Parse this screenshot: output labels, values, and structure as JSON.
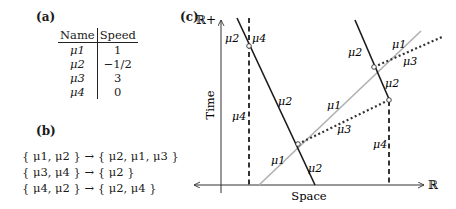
{
  "panel_a": {
    "label": "(a)",
    "table": {
      "headers": [
        "Name",
        "Speed"
      ],
      "rows": [
        {
          "name": "μ1",
          "speed": "1"
        },
        {
          "name": "μ2",
          "speed": "−1/2"
        },
        {
          "name": "μ3",
          "speed": "3"
        },
        {
          "name": "μ4",
          "speed": "0"
        }
      ]
    }
  },
  "panel_b": {
    "label": "(b)",
    "rules": [
      "{ μ1, μ2 } → { μ2, μ1, μ3 }",
      "{ μ3, μ4 } → { μ2 }",
      "{ μ4, μ2 } → { μ2, μ4 }"
    ]
  },
  "panel_c": {
    "label": "(c)",
    "y_axis_top_label": "ℝ+",
    "y_axis_label": "Time",
    "x_axis_label": "Space",
    "x_axis_end_label": "ℝ",
    "line_labels": {
      "mu1_upper": "μ1",
      "mu1_middle": "μ1",
      "mu1_lower": "μ1",
      "mu2_topleft": "μ2",
      "mu2_left_mid": "μ2",
      "mu2_left_bottom": "μ2",
      "mu2_right_top": "μ2",
      "mu2_right_mid": "μ2",
      "mu3_upper": "μ3",
      "mu3_lower": "μ3",
      "mu4_top": "μ4",
      "mu4_left_mid": "μ4",
      "mu4_right": "μ4"
    },
    "colors": {
      "axis": "#333333",
      "mu1": "#b0b0b0",
      "mu2": "#1a1a1a",
      "mu3": "#333333",
      "mu4": "#333333"
    }
  }
}
